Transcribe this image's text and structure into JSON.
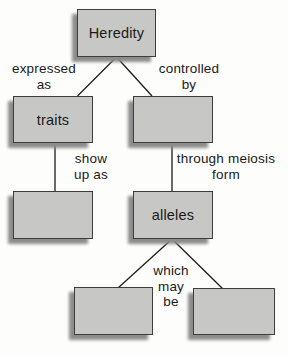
{
  "diagram": {
    "background": "#fdfdfb",
    "colors": {
      "bg": "#fdfdfb",
      "box_fill": "#c7c8c5",
      "box_border": "#3d3d3d",
      "box_shadow": "#8c8c8c",
      "edge_line": "#1c1c1c",
      "text": "#1a1a1a"
    },
    "nodes": {
      "heredity": {
        "label": "Heredity"
      },
      "traits": {
        "label": "traits"
      },
      "controlled_by_target": {
        "label": ""
      },
      "show_up_as_target": {
        "label": ""
      },
      "alleles": {
        "label": "alleles"
      },
      "which_left": {
        "label": ""
      },
      "which_right": {
        "label": ""
      }
    },
    "edge_labels": {
      "expressed_as": {
        "line1": "expressed",
        "line2": "as"
      },
      "controlled_by": {
        "line1": "controlled",
        "line2": "by"
      },
      "show_up_as": {
        "line1": "show",
        "line2": "up as"
      },
      "through_meiosis_form": {
        "line1": "through meiosis",
        "line2": "form"
      },
      "which_may_be": {
        "line1": "which",
        "line2": "may",
        "line3": "be"
      }
    }
  }
}
